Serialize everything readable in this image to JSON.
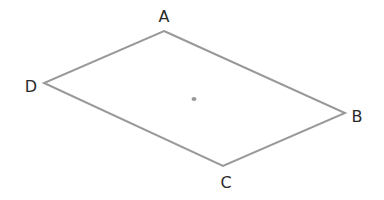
{
  "diagram": {
    "type": "parallelogram",
    "colors": {
      "stroke": "#999999",
      "label": "#2a2a2a",
      "background": "#ffffff"
    },
    "vertices": [
      {
        "name": "A",
        "x": 164,
        "y": 31,
        "label_x": 164,
        "label_y": 16
      },
      {
        "name": "B",
        "x": 345,
        "y": 113,
        "label_x": 357,
        "label_y": 116
      },
      {
        "name": "C",
        "x": 223,
        "y": 166,
        "label_x": 226,
        "label_y": 182
      },
      {
        "name": "D",
        "x": 44,
        "y": 83,
        "label_x": 31,
        "label_y": 86
      }
    ],
    "center_point": {
      "x": 194,
      "y": 99
    }
  }
}
